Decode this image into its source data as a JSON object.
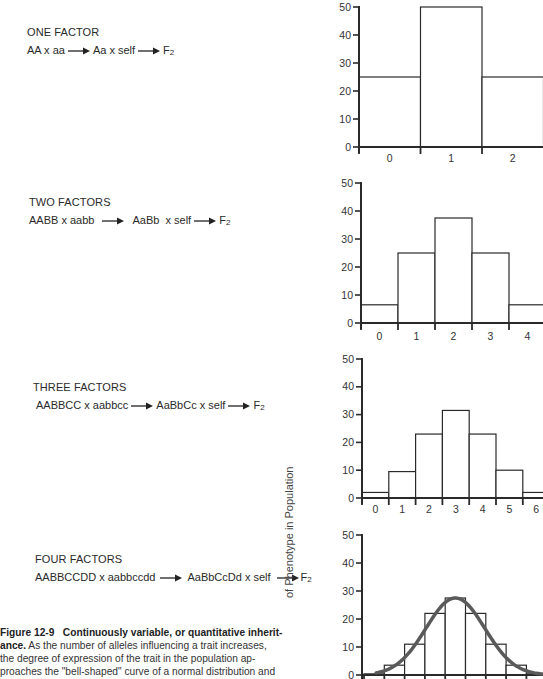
{
  "figure": {
    "number": "Figure 12-9",
    "title": "Continuously variable, or quantitative inherit-",
    "title_cont": "ance.",
    "caption_lines": [
      "As the number of alleles influencing a trait increases,",
      "the degree of expression of the trait in the population ap-",
      "proaches the \"bell-shaped\" curve of a normal distribution and"
    ],
    "y_axis_label": "of Phenotype in Population"
  },
  "crosses": [
    {
      "title": "ONE FACTOR",
      "parents": "AA x aa",
      "f1": "Aa x self",
      "f2": "F",
      "f2_sub": "2"
    },
    {
      "title": "TWO FACTORS",
      "parents": "AABB x aabb",
      "f1": "AaBb  x self",
      "f2": "F",
      "f2_sub": "2"
    },
    {
      "title": "THREE FACTORS",
      "parents": "AABBCC x aabbcc",
      "f1": "AaBbCc x self",
      "f2": "F",
      "f2_sub": "2"
    },
    {
      "title": "FOUR FACTORS",
      "parents": "AABBCCDD x aabbccdd",
      "f1": "AaBbCcDd x self",
      "f2": "F",
      "f2_sub": "2"
    }
  ],
  "chart_data": [
    {
      "type": "bar",
      "title": "ONE FACTOR",
      "categories": [
        "0",
        "1",
        "2"
      ],
      "values": [
        25,
        50,
        25
      ],
      "ylabel": "% of Phenotype in Population",
      "yticks": [
        0,
        10,
        20,
        30,
        40,
        50
      ],
      "ylim": [
        0,
        50
      ],
      "grid": false
    },
    {
      "type": "bar",
      "title": "TWO FACTORS",
      "categories": [
        "0",
        "1",
        "2",
        "3",
        "4"
      ],
      "values": [
        6.5,
        25,
        37.5,
        25,
        6.5
      ],
      "ylabel": "% of Phenotype in Population",
      "yticks": [
        0,
        10,
        20,
        30,
        40,
        50
      ],
      "ylim": [
        0,
        50
      ],
      "grid": false
    },
    {
      "type": "bar",
      "title": "THREE FACTORS",
      "categories": [
        "0",
        "1",
        "2",
        "3",
        "4",
        "5",
        "6"
      ],
      "values": [
        2,
        9.5,
        23,
        31.5,
        23,
        10,
        2
      ],
      "ylabel": "% of Phenotype in Population",
      "yticks": [
        0,
        10,
        20,
        30,
        40,
        50
      ],
      "ylim": [
        0,
        50
      ],
      "grid": false
    },
    {
      "type": "bar",
      "title": "FOUR FACTORS",
      "categories": [
        "0",
        "1",
        "2",
        "3",
        "4",
        "5",
        "6",
        "7",
        "8"
      ],
      "values": [
        0.4,
        3.5,
        11,
        22,
        27.5,
        22,
        11,
        3.5,
        0.4
      ],
      "overlay": "normal distribution curve (bell-shaped)",
      "ylabel": "% of Phenotype in Population",
      "yticks": [
        0,
        10,
        20,
        30,
        40,
        50
      ],
      "ylim": [
        0,
        50
      ],
      "grid": false
    }
  ],
  "colors": {
    "ink": "#2a2a2a",
    "curve": "#5a5a5a",
    "background": "#ffffff"
  }
}
